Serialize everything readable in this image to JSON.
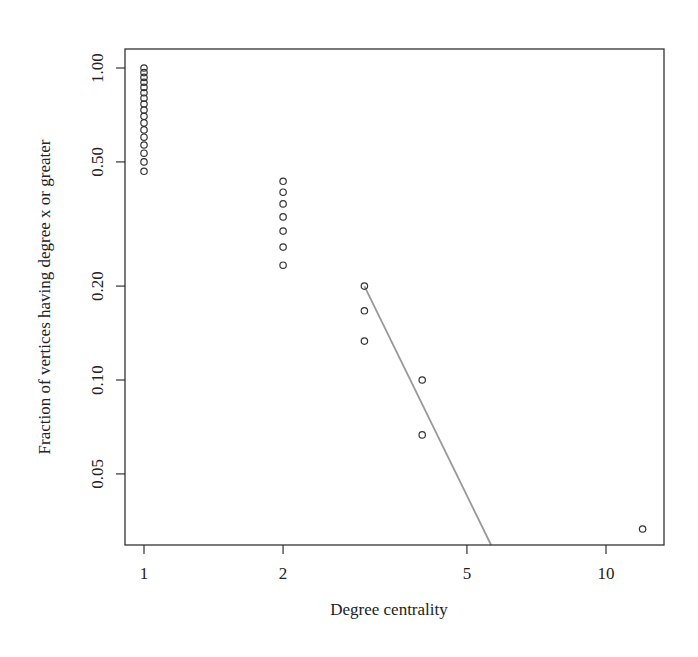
{
  "chart_data": {
    "type": "scatter",
    "title": "",
    "xlabel": "Degree centrality",
    "ylabel": "Fraction of vertices having degree x or greater",
    "xscale": "log",
    "yscale": "log",
    "xlim": [
      0.96,
      12.9
    ],
    "ylim": [
      0.0296,
      1.13
    ],
    "x_ticks": [
      {
        "value": 1,
        "label": "1"
      },
      {
        "value": 2,
        "label": "2"
      },
      {
        "value": 5,
        "label": "5"
      },
      {
        "value": 10,
        "label": "10"
      }
    ],
    "y_ticks": [
      {
        "value": 0.05,
        "label": "0.05"
      },
      {
        "value": 0.1,
        "label": "0.10"
      },
      {
        "value": 0.2,
        "label": "0.20"
      },
      {
        "value": 0.5,
        "label": "0.50"
      },
      {
        "value": 1.0,
        "label": "1.00"
      }
    ],
    "grid": false,
    "legend": null,
    "series": [
      {
        "name": "empirical CCDF",
        "marker": "open-circle",
        "color": "#333333",
        "points": [
          [
            1,
            1.0
          ],
          [
            1,
            0.9667
          ],
          [
            1,
            0.9333
          ],
          [
            1,
            0.9
          ],
          [
            1,
            0.8667
          ],
          [
            1,
            0.8333
          ],
          [
            1,
            0.8
          ],
          [
            1,
            0.7667
          ],
          [
            1,
            0.7333
          ],
          [
            1,
            0.7
          ],
          [
            1,
            0.6667
          ],
          [
            1,
            0.6333
          ],
          [
            1,
            0.6
          ],
          [
            1,
            0.5667
          ],
          [
            1,
            0.5333
          ],
          [
            1,
            0.5
          ],
          [
            1,
            0.4667
          ],
          [
            2,
            0.4333
          ],
          [
            2,
            0.4
          ],
          [
            2,
            0.3667
          ],
          [
            2,
            0.3333
          ],
          [
            2,
            0.3
          ],
          [
            2,
            0.2667
          ],
          [
            2,
            0.2333
          ],
          [
            3,
            0.2
          ],
          [
            3,
            0.1667
          ],
          [
            3,
            0.1333
          ],
          [
            4,
            0.1
          ],
          [
            4,
            0.0667
          ],
          [
            12,
            0.0333
          ]
        ]
      },
      {
        "name": "power-law fit",
        "type": "line",
        "color": "#999999",
        "points": [
          [
            3,
            0.2
          ],
          [
            5.64,
            0.0296
          ]
        ]
      }
    ]
  }
}
